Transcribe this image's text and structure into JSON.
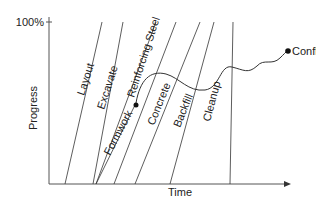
{
  "diagram": {
    "type": "line-of-balance progress chart",
    "y_axis": {
      "label": "Progress",
      "top_tick_label": "100%"
    },
    "x_axis": {
      "label": "Time"
    },
    "activities": [
      {
        "name": "Layout"
      },
      {
        "name": "Excavate"
      },
      {
        "name": "Formwork"
      },
      {
        "name": "Reinforcing Steel"
      },
      {
        "name": "Concrete"
      },
      {
        "name": "Backfill"
      },
      {
        "name": "Cleanup"
      }
    ],
    "annotation": {
      "label": "Conflict"
    },
    "colors": {
      "line": "#333333",
      "axis": "#555555",
      "text": "#222222",
      "background": "#ffffff"
    }
  }
}
